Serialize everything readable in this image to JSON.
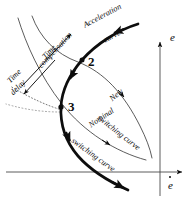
{
  "figure": {
    "type": "phase-plane-diagram",
    "background_color": "#ffffff",
    "ink_color": "#0d0d0d"
  },
  "axes": {
    "vertical": {
      "label": "e",
      "name": "error-axis",
      "arrow": "up",
      "x": 160,
      "top_y": 40,
      "bottom_y": 196
    },
    "horizontal": {
      "label": "e",
      "label_has_dot": true,
      "name": "error-rate-axis",
      "arrow": "right",
      "y": 172,
      "left_x": 6,
      "right_x": 184
    }
  },
  "labels": {
    "acceleration_curve": "Acceleration\ncurve",
    "acceleration_curve_line1": "Acceleration",
    "acceleration_curve_line2": "curve",
    "new_switching_curve_line1": "New",
    "new_switching_curve_line2": "switching curve",
    "nominal_switching_curve_line1": "Nominal",
    "nominal_switching_curve_line2": "switching curve",
    "time_compensation_line1": "Time",
    "time_compensation_line2": "compensation",
    "time_delay_line1": "Time",
    "time_delay_line2": "delay",
    "node_2": "2",
    "node_3": "3",
    "axis_e": "e",
    "axis_edot": "e"
  },
  "nodes": [
    {
      "id": "node-2",
      "label": "2",
      "x": 78,
      "y": 60,
      "marker": "filled-dot"
    },
    {
      "id": "node-3",
      "label": "3",
      "x": 62,
      "y": 108,
      "marker": "filled-dot"
    }
  ],
  "curves": [
    {
      "name": "acceleration-curve",
      "style": "thick-solid",
      "stroke_width": 2.6,
      "description": "Heavy trajectory entering from upper right, passing node 2, bending left to node 3, then sweeping down and right across the horizontal axis with an arrowhead.",
      "arrow_count": 5
    },
    {
      "name": "new-switching-curve",
      "style": "thin-solid",
      "stroke_width": 0.9,
      "description": "Light curve from upper left through node 2 region, sweeping down right toward the vertical axis."
    },
    {
      "name": "nominal-switching-curve",
      "style": "thin-solid",
      "stroke_width": 0.9,
      "description": "Light curve through node 3 sweeping down and right toward the vertical axis, below the new switching curve."
    },
    {
      "name": "time-delay-guide",
      "style": "dotted",
      "stroke_width": 0.9,
      "description": "Dotted construction line running from the node 3 area down-left off to the left margin."
    }
  ],
  "annotations": [
    {
      "name": "time-compensation-arrow",
      "direction": "up-right",
      "label": "Time compensation"
    },
    {
      "name": "time-delay-arrow",
      "direction": "down-left",
      "label": "Time delay"
    }
  ]
}
